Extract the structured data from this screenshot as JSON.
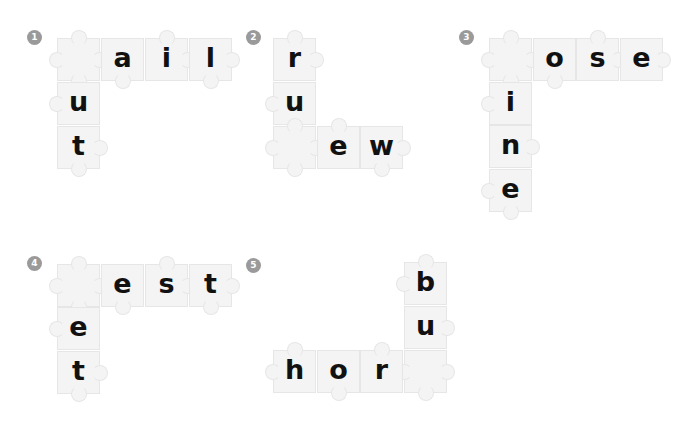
{
  "worksheet": {
    "puzzles": [
      {
        "number": "1",
        "badge": {
          "x": 27,
          "y": 30
        },
        "pieces": [
          {
            "x": 57,
            "y": 38,
            "letter": "",
            "knobs": [
              "top",
              "left",
              "right",
              "bottom"
            ]
          },
          {
            "x": 101,
            "y": 38,
            "letter": "a",
            "knobs": [
              "bottom"
            ]
          },
          {
            "x": 145,
            "y": 38,
            "letter": "i",
            "knobs": [
              "top",
              "right"
            ]
          },
          {
            "x": 189,
            "y": 38,
            "letter": "l",
            "knobs": [
              "right",
              "bottom"
            ]
          },
          {
            "x": 57,
            "y": 82,
            "letter": "u",
            "knobs": [
              "left"
            ]
          },
          {
            "x": 57,
            "y": 126,
            "letter": "t",
            "knobs": [
              "right",
              "bottom"
            ]
          }
        ]
      },
      {
        "number": "2",
        "badge": {
          "x": 246,
          "y": 30
        },
        "pieces": [
          {
            "x": 273,
            "y": 38,
            "letter": "r",
            "knobs": [
              "top",
              "right"
            ]
          },
          {
            "x": 273,
            "y": 82,
            "letter": "u",
            "knobs": [
              "left"
            ]
          },
          {
            "x": 273,
            "y": 126,
            "letter": "",
            "knobs": [
              "top",
              "left",
              "right",
              "bottom"
            ]
          },
          {
            "x": 317,
            "y": 126,
            "letter": "e",
            "knobs": [
              "top"
            ]
          },
          {
            "x": 360,
            "y": 126,
            "letter": "w",
            "knobs": [
              "right",
              "bottom"
            ]
          }
        ]
      },
      {
        "number": "3",
        "badge": {
          "x": 459,
          "y": 30
        },
        "pieces": [
          {
            "x": 489,
            "y": 38,
            "letter": "",
            "knobs": [
              "top",
              "left",
              "right",
              "bottom"
            ]
          },
          {
            "x": 533,
            "y": 38,
            "letter": "o",
            "knobs": [
              "bottom"
            ]
          },
          {
            "x": 576,
            "y": 38,
            "letter": "s",
            "knobs": [
              "top",
              "right"
            ]
          },
          {
            "x": 620,
            "y": 38,
            "letter": "e",
            "knobs": [
              "right"
            ]
          },
          {
            "x": 489,
            "y": 82,
            "letter": "i",
            "knobs": [
              "left"
            ]
          },
          {
            "x": 489,
            "y": 125,
            "letter": "n",
            "knobs": [
              "right"
            ]
          },
          {
            "x": 489,
            "y": 169,
            "letter": "e",
            "knobs": [
              "left",
              "bottom"
            ]
          }
        ]
      },
      {
        "number": "4",
        "badge": {
          "x": 27,
          "y": 256
        },
        "pieces": [
          {
            "x": 57,
            "y": 264,
            "letter": "",
            "knobs": [
              "top",
              "left",
              "right",
              "bottom"
            ]
          },
          {
            "x": 101,
            "y": 264,
            "letter": "e",
            "knobs": [
              "bottom"
            ]
          },
          {
            "x": 145,
            "y": 264,
            "letter": "s",
            "knobs": [
              "top",
              "right"
            ]
          },
          {
            "x": 189,
            "y": 264,
            "letter": "t",
            "knobs": [
              "right",
              "bottom"
            ]
          },
          {
            "x": 57,
            "y": 307,
            "letter": "e",
            "knobs": [
              "left"
            ]
          },
          {
            "x": 57,
            "y": 351,
            "letter": "t",
            "knobs": [
              "right",
              "bottom"
            ]
          }
        ]
      },
      {
        "number": "5",
        "badge": {
          "x": 246,
          "y": 258
        },
        "pieces": [
          {
            "x": 404,
            "y": 262,
            "letter": "b",
            "knobs": [
              "top",
              "left"
            ]
          },
          {
            "x": 404,
            "y": 306,
            "letter": "u",
            "knobs": [
              "right"
            ]
          },
          {
            "x": 404,
            "y": 350,
            "letter": "",
            "knobs": [
              "left",
              "right",
              "bottom"
            ]
          },
          {
            "x": 273,
            "y": 350,
            "letter": "h",
            "knobs": [
              "top",
              "left"
            ]
          },
          {
            "x": 317,
            "y": 350,
            "letter": "o",
            "knobs": [
              "bottom"
            ]
          },
          {
            "x": 360,
            "y": 350,
            "letter": "r",
            "knobs": [
              "top"
            ]
          }
        ]
      }
    ]
  }
}
